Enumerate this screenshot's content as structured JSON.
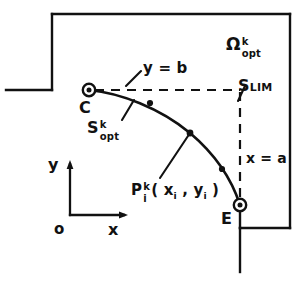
{
  "figure": {
    "stroke_color": "#111111",
    "background_color": "#ffffff"
  },
  "labels": {
    "omega": {
      "base": "Ω",
      "sup": "k",
      "sub": "opt"
    },
    "s_lim": {
      "base": "S",
      "sub": "LIM"
    },
    "y_equals_b": "y = b",
    "x_equals_a": "x = a",
    "point_c": "C",
    "point_e": "E",
    "s_opt": {
      "base": "S",
      "sup": "k",
      "sub": "opt"
    },
    "p_i": {
      "base": "P",
      "sup": "k",
      "sub": "i",
      "args": "( x",
      "args_sub1": "i",
      "args_mid": " , y",
      "args_sub2": "i",
      "args_end": " )"
    },
    "axis_y": "y",
    "axis_x": "x",
    "axis_origin": "o"
  },
  "geometry": {
    "region_border": {
      "description": "solid outer boundary of feasible region",
      "points": "L-shaped polyline"
    },
    "curve_points": [
      {
        "name": "C",
        "x": 89,
        "y": 90
      },
      {
        "name": "node-1",
        "x": 150,
        "y": 103
      },
      {
        "name": "P_i",
        "x": 190,
        "y": 133
      },
      {
        "name": "node-3",
        "x": 222,
        "y": 169
      },
      {
        "name": "E",
        "x": 240,
        "y": 205
      }
    ],
    "corner_point": {
      "x": 240,
      "y": 90,
      "label": "(a, b)"
    },
    "dashed_lines": [
      {
        "name": "y=b horizontal",
        "from": [
          89,
          90
        ],
        "to": [
          240,
          90
        ]
      },
      {
        "name": "x=a vertical",
        "from": [
          240,
          90
        ],
        "to": [
          240,
          205
        ]
      }
    ],
    "axes": {
      "origin": [
        70,
        215
      ],
      "y_tip": [
        70,
        162
      ],
      "x_tip": [
        125,
        215
      ]
    }
  }
}
